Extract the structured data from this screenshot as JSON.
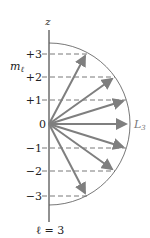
{
  "diagram": {
    "axis_label": "z",
    "ml_label": "m",
    "ml_subscript": "ℓ",
    "vector_label": "L",
    "vector_subscript": "3",
    "bottom_label": "ℓ = 3",
    "ticks": [
      {
        "label": "+3",
        "value": 3
      },
      {
        "label": "+2",
        "value": 2
      },
      {
        "label": "+1",
        "value": 1
      },
      {
        "label": "0",
        "value": 0
      },
      {
        "label": "−1",
        "value": -1
      },
      {
        "label": "−2",
        "value": -2
      },
      {
        "label": "−3",
        "value": -3
      }
    ],
    "colors": {
      "arrow": "#7f7f7f",
      "axis": "#222222",
      "circle": "#555555",
      "dashed": "#555555"
    }
  }
}
